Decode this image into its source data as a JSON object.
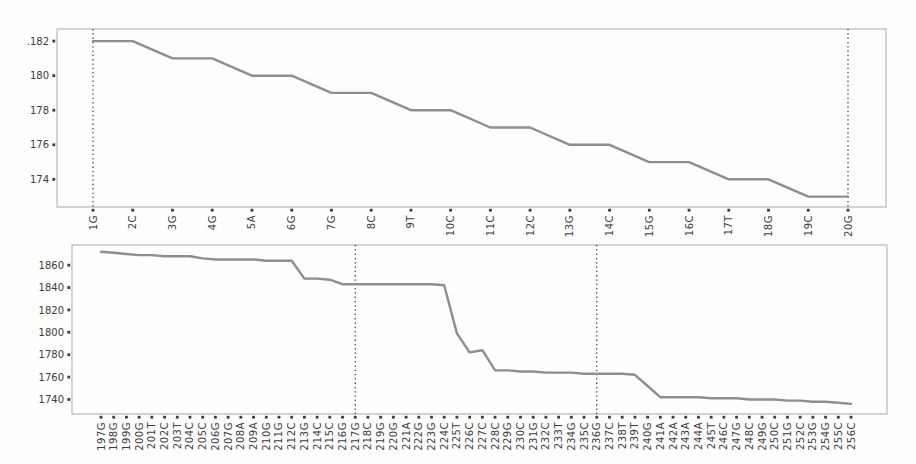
{
  "figure": {
    "background": "#fefefe",
    "title": ""
  },
  "chart_data": [
    {
      "type": "line",
      "title": "",
      "xlabel": "",
      "ylabel": "",
      "grid": false,
      "legend": null,
      "line_color": "#8e8e8e",
      "vline_color": "#2f2f2f",
      "tick_label_color": "#3c3c3c",
      "spine_color": "#a8a8a8",
      "ylim": [
        172.4,
        182.7
      ],
      "yticks": [
        {
          "label": ".182",
          "value": 182
        },
        {
          "label": "180",
          "value": 180
        },
        {
          "label": "178",
          "value": 178
        },
        {
          "label": "176",
          "value": 176
        },
        {
          "label": "174",
          "value": 174
        }
      ],
      "vlines": [
        "1G",
        "20G"
      ],
      "categories": [
        "1G",
        "2C",
        "3G",
        "4G",
        "5A",
        "6G",
        "7G",
        "8C",
        "9T",
        "10C",
        "11C",
        "12C",
        "13G",
        "14C",
        "15G",
        "16C",
        "17T",
        "18G",
        "19C",
        "20G"
      ],
      "values": [
        182,
        182,
        181,
        181,
        180,
        180,
        179,
        179,
        178,
        178,
        177,
        177,
        176,
        176,
        175,
        175,
        174,
        174,
        173,
        173
      ]
    },
    {
      "type": "line",
      "title": "",
      "xlabel": "",
      "ylabel": "",
      "grid": false,
      "legend": null,
      "line_color": "#8e8e8e",
      "vline_color": "#2f2f2f",
      "tick_label_color": "#3c3c3c",
      "spine_color": "#a8a8a8",
      "ylim": [
        1727,
        1878
      ],
      "yticks": [
        {
          "label": "1860",
          "value": 1860
        },
        {
          "label": "1840",
          "value": 1840
        },
        {
          "label": "1820",
          "value": 1820
        },
        {
          "label": "1800",
          "value": 1800
        },
        {
          "label": "1780",
          "value": 1780
        },
        {
          "label": "1760",
          "value": 1760
        },
        {
          "label": "1740",
          "value": 1740
        }
      ],
      "vlines": [
        "217G",
        "236G"
      ],
      "categories": [
        "197G",
        "198G",
        "199G",
        "200G",
        "201T",
        "202C",
        "203T",
        "204C",
        "205C",
        "206G",
        "207G",
        "208A",
        "209A",
        "210G",
        "211G",
        "212C",
        "213G",
        "214C",
        "215C",
        "216G",
        "217G",
        "218C",
        "219G",
        "220G",
        "221A",
        "222G",
        "223G",
        "224C",
        "225T",
        "226C",
        "227C",
        "228C",
        "229G",
        "230C",
        "231G",
        "232C",
        "233T",
        "234G",
        "235C",
        "236G",
        "237C",
        "238T",
        "239T",
        "240G",
        "241A",
        "242A",
        "243A",
        "244A",
        "245T",
        "246C",
        "247G",
        "248C",
        "249G",
        "250C",
        "251G",
        "252C",
        "253G",
        "254G",
        "255C",
        "256C"
      ],
      "values": [
        1872,
        1871,
        1870,
        1869,
        1869,
        1868,
        1868,
        1868,
        1866,
        1865,
        1865,
        1865,
        1865,
        1864,
        1864,
        1864,
        1848,
        1848,
        1847,
        1843,
        1843,
        1843,
        1843,
        1843,
        1843,
        1843,
        1843,
        1842,
        1799,
        1782,
        1784,
        1766,
        1766,
        1765,
        1765,
        1764,
        1764,
        1764,
        1763,
        1763,
        1763,
        1763,
        1762,
        1752,
        1742,
        1742,
        1742,
        1742,
        1741,
        1741,
        1741,
        1740,
        1740,
        1740,
        1739,
        1739,
        1738,
        1738,
        1737,
        1736
      ]
    }
  ]
}
